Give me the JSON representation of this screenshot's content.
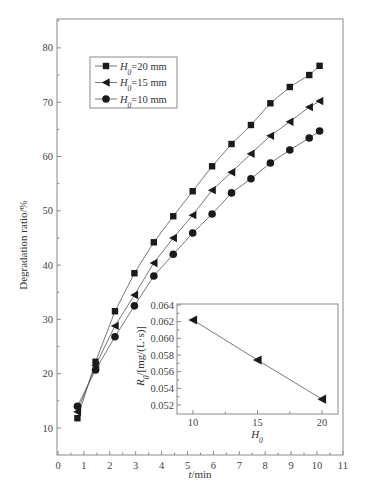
{
  "chart_data": [
    {
      "type": "line",
      "title": "",
      "xlabel": "t/min",
      "ylabel": "Degradation ratio/%",
      "xlim": [
        0,
        11
      ],
      "ylim": [
        5,
        85
      ],
      "xticks": [
        0,
        1,
        2,
        3,
        4,
        5,
        6,
        7,
        8,
        9,
        10,
        11
      ],
      "yticks": [
        10,
        20,
        30,
        40,
        50,
        60,
        70,
        80
      ],
      "grid": false,
      "legend_position": "upper left",
      "x": [
        0.75,
        1.45,
        2.2,
        2.95,
        3.7,
        4.45,
        5.2,
        5.95,
        6.7,
        7.45,
        8.2,
        8.95,
        9.7,
        10.1
      ],
      "series": [
        {
          "name": "H0=20 mm",
          "marker": "square",
          "values": [
            11.8,
            22.2,
            31.5,
            38.5,
            44.2,
            49.0,
            53.6,
            58.2,
            62.3,
            65.8,
            69.8,
            72.8,
            75.0,
            76.7
          ]
        },
        {
          "name": "H0=15 mm",
          "marker": "triangle-left",
          "values": [
            13.0,
            21.5,
            28.8,
            34.5,
            40.4,
            45.0,
            49.2,
            53.8,
            57.1,
            60.5,
            63.8,
            66.4,
            69.1,
            70.2
          ]
        },
        {
          "name": "H0=10 mm",
          "marker": "circle",
          "values": [
            14.0,
            20.7,
            26.8,
            32.5,
            38.0,
            42.0,
            45.9,
            49.4,
            53.3,
            55.9,
            58.8,
            61.2,
            63.4,
            64.7
          ]
        }
      ]
    },
    {
      "type": "line",
      "title": "inset",
      "xlabel": "H0",
      "ylabel": "R0/[mg/(L·s)]",
      "xlim": [
        9,
        21
      ],
      "ylim": [
        0.051,
        0.0641
      ],
      "xticks": [
        10,
        15,
        20
      ],
      "yticks": [
        0.052,
        0.054,
        0.056,
        0.058,
        0.06,
        0.062,
        0.064
      ],
      "grid": false,
      "x": [
        10,
        15,
        20
      ],
      "series": [
        {
          "name": "R0",
          "marker": "triangle-left",
          "values": [
            0.0622,
            0.0574,
            0.0527
          ]
        }
      ]
    }
  ],
  "labels": {
    "main_xlabel_italic": "t",
    "main_xlabel_rest": "/min",
    "main_ylabel": "Degradation ratio/%",
    "legend": [
      {
        "prefix": "H",
        "sub": "0",
        "suffix": "=20 mm"
      },
      {
        "prefix": "H",
        "sub": "0",
        "suffix": "=15 mm"
      },
      {
        "prefix": "H",
        "sub": "0",
        "suffix": "=10 mm"
      }
    ],
    "inset_xlabel_prefix": "H",
    "inset_xlabel_sub": "0",
    "inset_ylabel_prefix": "R",
    "inset_ylabel_sub": "0",
    "inset_ylabel_suffix": "/[mg/(L·s)]"
  },
  "colors": {
    "axis": "#8a8a8a",
    "marker": "#1a1a1a",
    "line": "#555555",
    "text": "#333333"
  }
}
